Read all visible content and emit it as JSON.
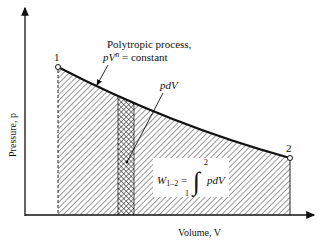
{
  "diagram": {
    "type": "pV diagram",
    "axes": {
      "y_label": "Pressure, p",
      "x_label": "Volume, V"
    },
    "points": [
      {
        "label": "1"
      },
      {
        "label": "2"
      }
    ],
    "annotations": {
      "process_line1": "Polytropic process,",
      "process_line2_p": "pV",
      "process_line2_exp": "n",
      "process_line2_rest": " = constant",
      "strip_label": "pdV",
      "work_lhs": "W",
      "work_sub": "1–2",
      "work_eq": " =",
      "integral_upper": "2",
      "integral_lower": "1",
      "integrand": "pdV"
    },
    "colors": {
      "line": "#111111",
      "hatch": "#333333",
      "background": "#ffffff"
    }
  }
}
